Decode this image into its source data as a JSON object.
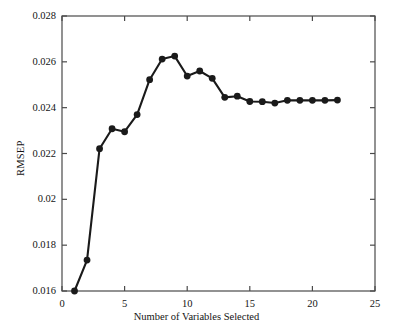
{
  "chart_data": {
    "type": "line",
    "title": "",
    "xlabel": "Number of Variables Selected",
    "ylabel": "RMSEP",
    "xlim": [
      0,
      25
    ],
    "ylim": [
      0.016,
      0.028
    ],
    "xticks": [
      "0",
      "5",
      "10",
      "15",
      "20",
      "25"
    ],
    "xtick_values": [
      0,
      5,
      10,
      15,
      20,
      25
    ],
    "yticks": [
      "0.016",
      "0.018",
      "0.02",
      "0.022",
      "0.024",
      "0.026",
      "0.028"
    ],
    "ytick_values": [
      0.016,
      0.018,
      0.02,
      0.022,
      0.024,
      0.026,
      0.028
    ],
    "grid": false,
    "legend": null,
    "marker": "filled-circle",
    "line_color": "#1a1a1a",
    "marker_color": "#1a1a1a",
    "x": [
      1,
      2,
      3,
      4,
      5,
      6,
      7,
      8,
      9,
      10,
      11,
      12,
      13,
      14,
      15,
      16,
      17,
      18,
      19,
      20,
      21,
      22
    ],
    "values": [
      0.016,
      0.01735,
      0.02221,
      0.02308,
      0.02295,
      0.0237,
      0.02522,
      0.02612,
      0.02625,
      0.02538,
      0.0256,
      0.02528,
      0.02445,
      0.0245,
      0.02427,
      0.02426,
      0.0242,
      0.02432,
      0.02432,
      0.02432,
      0.02432,
      0.02433
    ],
    "series": [
      {
        "name": "RMSEP",
        "values": [
          0.016,
          0.01735,
          0.02221,
          0.02308,
          0.02295,
          0.0237,
          0.02522,
          0.02612,
          0.02625,
          0.02538,
          0.0256,
          0.02528,
          0.02445,
          0.0245,
          0.02427,
          0.02426,
          0.0242,
          0.02432,
          0.02432,
          0.02432,
          0.02432,
          0.02433
        ]
      }
    ]
  }
}
